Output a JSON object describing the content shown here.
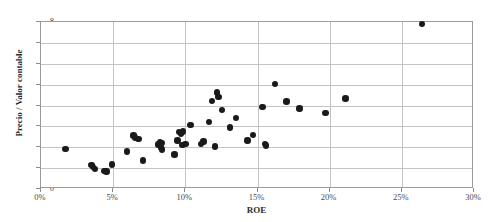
{
  "chart": {
    "type": "scatter",
    "title": "",
    "xlabel": "ROE",
    "ylabel": "Precio / Valor contable"
  },
  "axes": {
    "x_ticks": [
      "0%",
      "5%",
      "10%",
      "15%",
      "20%",
      "25%",
      "30%"
    ],
    "y_ticks": [
      "8",
      "7",
      "6",
      "5",
      "4",
      "3",
      "2",
      "1",
      "0"
    ]
  },
  "chart_data": {
    "type": "scatter",
    "title": "",
    "xlabel": "ROE",
    "ylabel": "Precio / Valor contable",
    "xlim": [
      0,
      30
    ],
    "ylim": [
      0,
      8
    ],
    "x_unit": "percent",
    "xticks": [
      0,
      5,
      10,
      15,
      20,
      25,
      30
    ],
    "yticks": [
      0,
      1,
      2,
      3,
      4,
      5,
      6,
      7,
      8
    ],
    "xtick_labels": [
      "0%",
      "5%",
      "10%",
      "15%",
      "20%",
      "25%",
      "30%"
    ],
    "ytick_labels": [
      "0",
      "1",
      "2",
      "3",
      "4",
      "5",
      "6",
      "7",
      "8"
    ],
    "grid": "horizontal-and-vertical",
    "legend": "none",
    "marker": {
      "shape": "circle",
      "color": "#1a1a1a",
      "size": 6.4
    },
    "series": [
      {
        "name": "Empresas",
        "points": [
          [
            1.7,
            1.93
          ],
          [
            3.5,
            1.15
          ],
          [
            3.6,
            1.05
          ],
          [
            3.75,
            0.96
          ],
          [
            4.4,
            0.86
          ],
          [
            4.55,
            0.83
          ],
          [
            4.9,
            1.18
          ],
          [
            5.95,
            1.8
          ],
          [
            6.4,
            2.56
          ],
          [
            6.5,
            2.47
          ],
          [
            6.75,
            2.39
          ],
          [
            7.05,
            1.37
          ],
          [
            8.1,
            2.14
          ],
          [
            8.25,
            2.23
          ],
          [
            8.3,
            1.99
          ],
          [
            8.35,
            2.19
          ],
          [
            8.4,
            1.9
          ],
          [
            9.25,
            1.65
          ],
          [
            9.45,
            2.32
          ],
          [
            9.55,
            2.72
          ],
          [
            9.7,
            2.65
          ],
          [
            9.8,
            2.12
          ],
          [
            9.85,
            2.75
          ],
          [
            10.0,
            2.16
          ],
          [
            10.35,
            3.08
          ],
          [
            11.1,
            2.17
          ],
          [
            11.25,
            2.28
          ],
          [
            11.65,
            3.22
          ],
          [
            11.85,
            4.22
          ],
          [
            12.05,
            2.03
          ],
          [
            12.2,
            4.62
          ],
          [
            12.3,
            4.4
          ],
          [
            12.55,
            3.79
          ],
          [
            13.1,
            2.95
          ],
          [
            13.5,
            3.41
          ],
          [
            14.3,
            2.33
          ],
          [
            14.7,
            2.59
          ],
          [
            15.35,
            3.93
          ],
          [
            15.5,
            2.16
          ],
          [
            15.6,
            2.08
          ],
          [
            16.2,
            5.03
          ],
          [
            17.0,
            4.2
          ],
          [
            17.9,
            3.85
          ],
          [
            19.7,
            3.65
          ],
          [
            21.1,
            4.33
          ],
          [
            26.4,
            7.9
          ]
        ]
      }
    ]
  }
}
